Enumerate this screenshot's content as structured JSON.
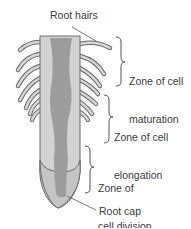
{
  "diagram": {
    "labels": {
      "root_hairs": "Root hairs",
      "maturation_line1": "Zone of cell",
      "maturation_line2": "maturation",
      "elongation_line1": "Zone of cell",
      "elongation_line2": "elongation",
      "division_line1": "Zone of",
      "division_line2": "cell division",
      "root_cap": "Root cap"
    },
    "colors": {
      "outer_tissue": "#cfcfcf",
      "vascular_core": "#9a9a9a",
      "root_cap": "#b8b8b8",
      "outline": "#6a6a6a",
      "text": "#3a3a3a"
    }
  }
}
